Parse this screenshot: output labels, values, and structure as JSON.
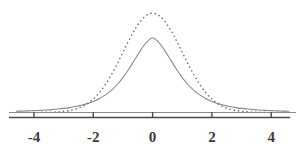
{
  "chart_data": {
    "type": "line",
    "title": "",
    "subtitle": "",
    "xlabel": "",
    "ylabel": "",
    "xlim": [
      -4.6,
      4.6
    ],
    "ylim": [
      0,
      0.43
    ],
    "xticks": [
      -4,
      -2,
      0,
      2,
      4
    ],
    "xtick_labels": [
      "-4",
      "-2",
      "0",
      "2",
      "4"
    ],
    "yticks": [],
    "ytick_labels": [],
    "grid": false,
    "legend": "none",
    "axis": {
      "x_axis_visible": true,
      "y_axis_visible": false,
      "baseline_visible": true,
      "tick_direction": "up",
      "axis_color": "#4a4a4a",
      "axis_start_x": -4.0,
      "axis_end_x": 4.0
    },
    "series": [
      {
        "name": "t distribution",
        "style": "solid",
        "color": "#8b8b8b",
        "linewidth": 1.1,
        "peak_x": 0,
        "peak_y": 0.345,
        "distribution": "student_t",
        "df": 3,
        "x": [
          -4.6,
          -4.4,
          -4.2,
          -4.0,
          -3.8,
          -3.6,
          -3.4,
          -3.2,
          -3.0,
          -2.8,
          -2.6,
          -2.4,
          -2.2,
          -2.0,
          -1.8,
          -1.6,
          -1.4,
          -1.2,
          -1.0,
          -0.8,
          -0.6,
          -0.4,
          -0.2,
          0.0,
          0.2,
          0.4,
          0.6,
          0.8,
          1.0,
          1.2,
          1.4,
          1.6,
          1.8,
          2.0,
          2.2,
          2.4,
          2.6,
          2.8,
          3.0,
          3.2,
          3.4,
          3.6,
          3.8,
          4.0,
          4.2,
          4.4,
          4.6
        ],
        "values": [
          0.0049,
          0.0056,
          0.0064,
          0.0074,
          0.0086,
          0.01,
          0.0117,
          0.0138,
          0.0165,
          0.0197,
          0.0238,
          0.029,
          0.0357,
          0.0443,
          0.0554,
          0.0698,
          0.0882,
          0.1115,
          0.1404,
          0.1746,
          0.2127,
          0.2508,
          0.2828,
          0.3001,
          0.2828,
          0.2508,
          0.2127,
          0.1746,
          0.1404,
          0.1115,
          0.0882,
          0.0698,
          0.0554,
          0.0443,
          0.0357,
          0.029,
          0.0238,
          0.0197,
          0.0165,
          0.0138,
          0.0117,
          0.01,
          0.0086,
          0.0074,
          0.0064,
          0.0056,
          0.0049
        ]
      },
      {
        "name": "normal distribution",
        "style": "dotted",
        "color": "#6e6e6e",
        "linewidth": 1.6,
        "peak_x": 0,
        "peak_y": 0.399,
        "distribution": "normal",
        "mean": 0,
        "sd": 1,
        "x": [
          -4.6,
          -4.4,
          -4.2,
          -4.0,
          -3.8,
          -3.6,
          -3.4,
          -3.2,
          -3.0,
          -2.8,
          -2.6,
          -2.4,
          -2.2,
          -2.0,
          -1.8,
          -1.6,
          -1.4,
          -1.2,
          -1.0,
          -0.8,
          -0.6,
          -0.4,
          -0.2,
          0.0,
          0.2,
          0.4,
          0.6,
          0.8,
          1.0,
          1.2,
          1.4,
          1.6,
          1.8,
          2.0,
          2.2,
          2.4,
          2.6,
          2.8,
          3.0,
          3.2,
          3.4,
          3.6,
          3.8,
          4.0,
          4.2,
          4.4,
          4.6
        ],
        "values": [
          1e-05,
          2e-05,
          4e-05,
          0.00013,
          0.00029,
          0.00061,
          0.00123,
          0.00238,
          0.00443,
          0.00792,
          0.01358,
          0.02239,
          0.03547,
          0.05399,
          0.07895,
          0.11092,
          0.14973,
          0.19419,
          0.24197,
          0.28969,
          0.33322,
          0.36827,
          0.39104,
          0.39894,
          0.39104,
          0.36827,
          0.33322,
          0.28969,
          0.24197,
          0.19419,
          0.14973,
          0.11092,
          0.07895,
          0.05399,
          0.03547,
          0.02239,
          0.01358,
          0.00792,
          0.00443,
          0.00238,
          0.00123,
          0.00061,
          0.00029,
          0.00013,
          4e-05,
          2e-05,
          1e-05
        ]
      }
    ]
  }
}
